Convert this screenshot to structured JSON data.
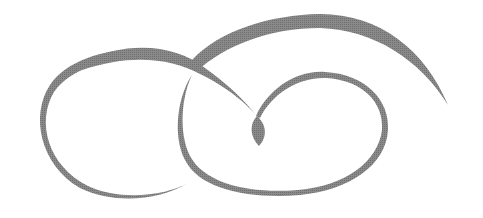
{
  "image": {
    "description": "Decorative calligraphic flourish ornament with two interlocking loops and a central teardrop",
    "width": 483,
    "height": 218,
    "background": "#ffffff",
    "stroke_color": "#7f7f7f"
  }
}
